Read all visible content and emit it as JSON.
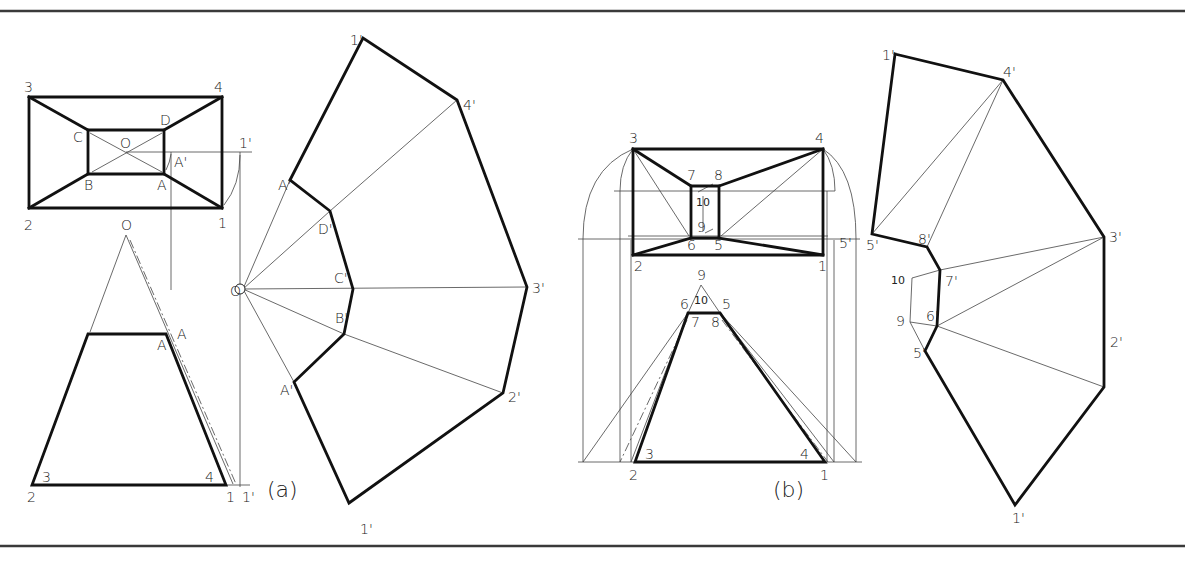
{
  "figure": {
    "frame": {
      "top_y": 11,
      "bottom_y": 546
    },
    "captions": [
      {
        "id": "a",
        "text": "(a)",
        "x": 267,
        "y": 497
      },
      {
        "id": "b",
        "text": "(b)",
        "x": 773,
        "y": 497
      }
    ]
  },
  "part_a": {
    "top_view": {
      "outer": [
        [
          29,
          97
        ],
        [
          222,
          97
        ],
        [
          222,
          208
        ],
        [
          29,
          208
        ]
      ],
      "inner": [
        [
          88,
          130
        ],
        [
          164,
          130
        ],
        [
          164,
          174
        ],
        [
          88,
          174
        ]
      ],
      "thick_lines": [
        [
          [
            29,
            97
          ],
          [
            88,
            130
          ]
        ],
        [
          [
            222,
            97
          ],
          [
            164,
            130
          ]
        ],
        [
          [
            29,
            208
          ],
          [
            88,
            174
          ]
        ],
        [
          [
            222,
            208
          ],
          [
            164,
            174
          ]
        ]
      ],
      "thin_lines": [
        [
          [
            90,
            133
          ],
          [
            162,
            172
          ]
        ],
        [
          [
            92,
            172
          ],
          [
            162,
            133
          ]
        ],
        [
          [
            126,
            152
          ],
          [
            252,
            152
          ]
        ],
        [
          [
            171,
            152
          ],
          [
            171,
            290
          ]
        ],
        [
          [
            240,
            152
          ],
          [
            240,
            487
          ]
        ]
      ],
      "arcs": [
        "M224,205 Q240,185 240,155",
        "M166,170 Q170,162 171,154"
      ],
      "labels": [
        {
          "text": "3",
          "x": 24,
          "y": 92
        },
        {
          "text": "4",
          "x": 214,
          "y": 92
        },
        {
          "text": "2",
          "x": 24,
          "y": 230
        },
        {
          "text": "1",
          "x": 218,
          "y": 228
        },
        {
          "text": "C",
          "x": 73,
          "y": 142
        },
        {
          "text": "D",
          "x": 160,
          "y": 125
        },
        {
          "text": "O",
          "x": 120,
          "y": 148
        },
        {
          "text": "B",
          "x": 84,
          "y": 190
        },
        {
          "text": "A",
          "x": 157,
          "y": 190
        },
        {
          "text": "A'",
          "x": 174,
          "y": 167
        },
        {
          "text": "1'",
          "x": 239,
          "y": 148
        }
      ]
    },
    "front_view": {
      "apex": [
        126,
        235
      ],
      "trapezoid": [
        [
          88,
          334
        ],
        [
          166,
          334
        ],
        [
          226,
          485
        ],
        [
          32,
          485
        ]
      ],
      "thin_lines": [
        [
          [
            126,
            235
          ],
          [
            90,
            332
          ]
        ],
        [
          [
            126,
            235
          ],
          [
            233,
            484
          ]
        ],
        [
          [
            120,
            485
          ],
          [
            250,
            485
          ]
        ]
      ],
      "dash_lines": [
        [
          [
            130,
            240
          ],
          [
            236,
            484
          ]
        ]
      ],
      "labels": [
        {
          "text": "O",
          "x": 121,
          "y": 230
        },
        {
          "text": "A",
          "x": 157,
          "y": 350
        },
        {
          "text": "A",
          "x": 177,
          "y": 339
        },
        {
          "text": "3",
          "x": 42,
          "y": 482
        },
        {
          "text": "4",
          "x": 205,
          "y": 482
        },
        {
          "text": "2",
          "x": 27,
          "y": 502
        },
        {
          "text": "1",
          "x": 226,
          "y": 502
        },
        {
          "text": "1'",
          "x": 242,
          "y": 502
        }
      ]
    },
    "development": {
      "origin": [
        243,
        289
      ],
      "outline": [
        [
          290,
          180
        ],
        [
          363,
          38
        ],
        [
          457,
          100
        ],
        [
          527,
          287
        ],
        [
          503,
          393
        ],
        [
          349,
          503
        ],
        [
          294,
          382
        ],
        [
          344,
          334
        ],
        [
          353,
          289
        ],
        [
          330,
          211
        ],
        [
          290,
          180
        ]
      ],
      "fold_lines": [
        [
          [
            243,
            289
          ],
          [
            290,
            180
          ]
        ],
        [
          [
            243,
            289
          ],
          [
            330,
            211
          ]
        ],
        [
          [
            330,
            211
          ],
          [
            457,
            100
          ]
        ],
        [
          [
            243,
            289
          ],
          [
            527,
            287
          ]
        ],
        [
          [
            243,
            289
          ],
          [
            344,
            334
          ]
        ],
        [
          [
            344,
            334
          ],
          [
            503,
            393
          ]
        ],
        [
          [
            243,
            289
          ],
          [
            294,
            382
          ]
        ]
      ],
      "labels": [
        {
          "text": "O",
          "x": 230,
          "y": 296
        },
        {
          "text": "1'",
          "x": 350,
          "y": 45
        },
        {
          "text": "4'",
          "x": 463,
          "y": 110
        },
        {
          "text": "A'",
          "x": 278,
          "y": 190
        },
        {
          "text": "D'",
          "x": 318,
          "y": 234
        },
        {
          "text": "C'",
          "x": 334,
          "y": 283
        },
        {
          "text": "3'",
          "x": 532,
          "y": 293
        },
        {
          "text": "B'",
          "x": 335,
          "y": 323
        },
        {
          "text": "A'",
          "x": 280,
          "y": 395
        },
        {
          "text": "2'",
          "x": 508,
          "y": 402
        },
        {
          "text": "1'",
          "x": 360,
          "y": 534
        }
      ]
    }
  },
  "part_b": {
    "top_view": {
      "outer": [
        [
          633,
          149
        ],
        [
          823,
          149
        ],
        [
          823,
          255
        ],
        [
          633,
          255
        ]
      ],
      "inner": [
        [
          691,
          186
        ],
        [
          719,
          186
        ],
        [
          719,
          238
        ],
        [
          691,
          238
        ]
      ],
      "thick_lines": [
        [
          [
            633,
            149
          ],
          [
            691,
            186
          ]
        ],
        [
          [
            823,
            149
          ],
          [
            719,
            186
          ]
        ],
        [
          [
            633,
            255
          ],
          [
            691,
            238
          ]
        ],
        [
          [
            823,
            255
          ],
          [
            719,
            238
          ]
        ]
      ],
      "thin_lines": [
        [
          [
            614,
            191
          ],
          [
            835,
            191
          ]
        ],
        [
          [
            578,
            239
          ],
          [
            860,
            239
          ]
        ],
        [
          [
            628,
            236
          ],
          [
            828,
            236
          ]
        ],
        [
          [
            633,
            149
          ],
          [
            689,
            236
          ]
        ],
        [
          [
            823,
            149
          ],
          [
            721,
            236
          ]
        ],
        [
          [
            703,
            196
          ],
          [
            703,
            231
          ]
        ],
        [
          [
            698,
            192
          ],
          [
            713,
            184
          ]
        ],
        [
          [
            705,
            233
          ],
          [
            713,
            229
          ]
        ]
      ],
      "verticals": [
        [
          [
            583,
            239
          ],
          [
            583,
            462
          ]
        ],
        [
          [
            620,
            191
          ],
          [
            620,
            462
          ]
        ],
        [
          [
            631,
            240
          ],
          [
            631,
            462
          ]
        ],
        [
          [
            827,
            191
          ],
          [
            827,
            462
          ]
        ],
        [
          [
            834,
            240
          ],
          [
            834,
            462
          ]
        ],
        [
          [
            856,
            239
          ],
          [
            856,
            462
          ]
        ]
      ],
      "arcs": [
        "M633,149 Q583,170 583,239",
        "M633,149 Q620,165 620,191",
        "M823,149 Q856,170 856,239",
        "M823,149 Q835,165 835,191"
      ],
      "labels": [
        {
          "text": "3",
          "x": 629,
          "y": 143
        },
        {
          "text": "4",
          "x": 815,
          "y": 143
        },
        {
          "text": "7",
          "x": 687,
          "y": 180
        },
        {
          "text": "8",
          "x": 714,
          "y": 180
        },
        {
          "text": "10",
          "x": 696,
          "y": 206
        },
        {
          "text": "9",
          "x": 697,
          "y": 232
        },
        {
          "text": "6",
          "x": 687,
          "y": 250
        },
        {
          "text": "5",
          "x": 714,
          "y": 250
        },
        {
          "text": "2",
          "x": 634,
          "y": 271
        },
        {
          "text": "1",
          "x": 818,
          "y": 271
        },
        {
          "text": "5'",
          "x": 839,
          "y": 248
        }
      ]
    },
    "front_view": {
      "apex": [
        701,
        285
      ],
      "trapezoid": [
        [
          688,
          313
        ],
        [
          720,
          313
        ],
        [
          825,
          462
        ],
        [
          635,
          462
        ]
      ],
      "ground_line": [
        [
          578,
          462
        ],
        [
          862,
          462
        ]
      ],
      "thin_lines": [
        [
          [
            701,
            285
          ],
          [
            688,
            313
          ]
        ],
        [
          [
            701,
            285
          ],
          [
            720,
            313
          ]
        ],
        [
          [
            688,
            313
          ],
          [
            583,
            462
          ]
        ],
        [
          [
            688,
            313
          ],
          [
            631,
            462
          ]
        ],
        [
          [
            720,
            313
          ],
          [
            834,
            462
          ]
        ],
        [
          [
            720,
            313
          ],
          [
            856,
            462
          ]
        ]
      ],
      "dash_lines": [
        [
          [
            687,
            320
          ],
          [
            620,
            462
          ]
        ],
        [
          [
            722,
            320
          ],
          [
            828,
            462
          ]
        ]
      ],
      "labels": [
        {
          "text": "9",
          "x": 697,
          "y": 280
        },
        {
          "text": "10",
          "x": 694,
          "y": 304
        },
        {
          "text": "6",
          "x": 680,
          "y": 309
        },
        {
          "text": "5",
          "x": 722,
          "y": 309
        },
        {
          "text": "7",
          "x": 691,
          "y": 327
        },
        {
          "text": "8",
          "x": 711,
          "y": 327
        },
        {
          "text": "3",
          "x": 645,
          "y": 459
        },
        {
          "text": "4",
          "x": 800,
          "y": 459
        },
        {
          "text": "2",
          "x": 629,
          "y": 480
        },
        {
          "text": "1",
          "x": 820,
          "y": 480
        }
      ]
    },
    "development": {
      "outline": [
        [
          895,
          54
        ],
        [
          1003,
          80
        ],
        [
          1104,
          237
        ],
        [
          1104,
          387
        ],
        [
          1015,
          505
        ],
        [
          925,
          351
        ],
        [
          937,
          326
        ],
        [
          940,
          270
        ],
        [
          927,
          247
        ],
        [
          872,
          234
        ],
        [
          895,
          54
        ]
      ],
      "fold_lines": [
        [
          [
            872,
            234
          ],
          [
            1003,
            80
          ]
        ],
        [
          [
            927,
            247
          ],
          [
            1003,
            80
          ]
        ],
        [
          [
            940,
            270
          ],
          [
            1104,
            237
          ]
        ],
        [
          [
            937,
            326
          ],
          [
            1104,
            237
          ]
        ],
        [
          [
            937,
            326
          ],
          [
            1104,
            387
          ]
        ],
        [
          [
            912,
            278
          ],
          [
            940,
            270
          ]
        ],
        [
          [
            910,
            322
          ],
          [
            937,
            326
          ]
        ],
        [
          [
            912,
            278
          ],
          [
            910,
            322
          ]
        ],
        [
          [
            910,
            322
          ],
          [
            925,
            351
          ]
        ]
      ],
      "labels": [
        {
          "text": "1'",
          "x": 882,
          "y": 60
        },
        {
          "text": "4'",
          "x": 1003,
          "y": 77
        },
        {
          "text": "8'",
          "x": 918,
          "y": 244
        },
        {
          "text": "5'",
          "x": 866,
          "y": 250
        },
        {
          "text": "3'",
          "x": 1109,
          "y": 242
        },
        {
          "text": "10",
          "x": 891,
          "y": 284
        },
        {
          "text": "7'",
          "x": 945,
          "y": 286
        },
        {
          "text": "6'",
          "x": 926,
          "y": 321
        },
        {
          "text": "9",
          "x": 896,
          "y": 326
        },
        {
          "text": "5'",
          "x": 913,
          "y": 358
        },
        {
          "text": "2'",
          "x": 1110,
          "y": 347
        },
        {
          "text": "1'",
          "x": 1012,
          "y": 523
        }
      ]
    }
  }
}
